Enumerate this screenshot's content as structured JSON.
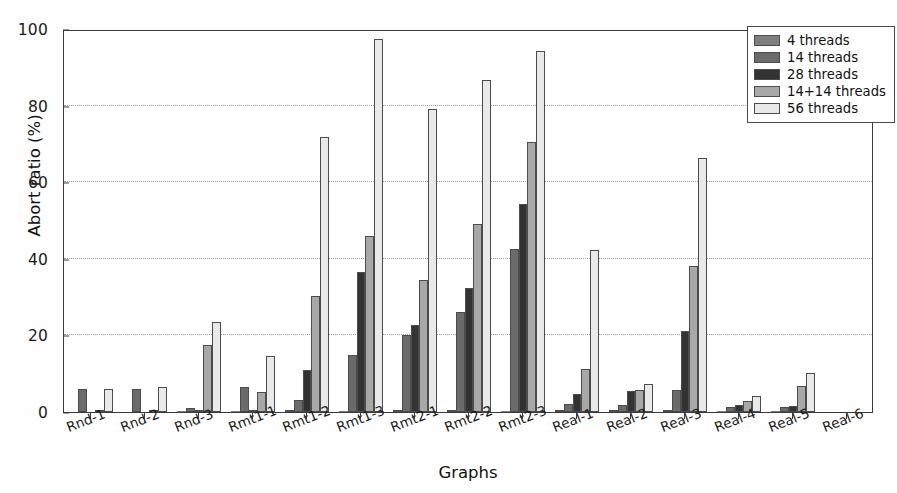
{
  "chart_data": {
    "type": "bar",
    "title": "",
    "xlabel": "Graphs",
    "ylabel": "Abort ratio (%)",
    "ylim": [
      0,
      100
    ],
    "yticks": [
      0,
      20,
      40,
      60,
      80,
      100
    ],
    "grid": "horizontal dotted at 20, 40, 60, 80",
    "legend_position": "upper right",
    "categories": [
      "Rnd-1",
      "Rnd-2",
      "Rnd-3",
      "Rmt1-1",
      "Rmt1-2",
      "Rmt1-3",
      "Rmt2-1",
      "Rmt2-2",
      "Rmt2-3",
      "Real-1",
      "Real-2",
      "Real-3",
      "Real-4",
      "Real-5",
      "Real-6"
    ],
    "series": [
      {
        "name": "4 threads",
        "color": "#7f7f7f",
        "values": [
          0.0,
          0.0,
          0.3,
          0.3,
          0.6,
          0.3,
          0.4,
          0.5,
          0.3,
          0.4,
          0.4,
          0.4,
          0.3,
          0.3,
          0.0
        ]
      },
      {
        "name": "14 threads",
        "color": "#6b6b6b",
        "values": [
          5.9,
          5.9,
          1.0,
          6.5,
          3.2,
          14.8,
          20.1,
          26.2,
          42.6,
          2.1,
          1.9,
          5.7,
          1.2,
          1.4,
          0.0
        ]
      },
      {
        "name": "28 threads",
        "color": "#333333",
        "values": [
          0.0,
          0.0,
          0.4,
          0.4,
          11.0,
          36.6,
          22.8,
          32.5,
          54.3,
          4.6,
          5.6,
          21.1,
          1.9,
          1.6,
          0.0
        ]
      },
      {
        "name": "14+14 threads",
        "color": "#a8a8a8",
        "values": [
          0.4,
          0.5,
          17.4,
          5.3,
          30.2,
          46.0,
          34.4,
          49.0,
          70.5,
          11.2,
          5.7,
          38.2,
          2.8,
          6.7,
          0.0
        ]
      },
      {
        "name": "56 threads",
        "color": "#e9e9e9",
        "values": [
          5.9,
          6.5,
          23.4,
          14.7,
          71.8,
          88.0,
          53.6,
          66.8,
          82.9,
          26.8,
          7.4,
          66.4,
          4.2,
          10.2,
          0.0
        ]
      }
    ],
    "extra_tall_bars": [
      {
        "category": "Rmt1-3",
        "series": "56 threads",
        "value": 97.4
      },
      {
        "category": "Rmt2-1",
        "series": "56 threads",
        "value": 79.0
      },
      {
        "category": "Rmt2-2",
        "series": "56 threads",
        "value": 86.6
      },
      {
        "category": "Rmt2-3",
        "series": "56 threads",
        "value": 94.3
      },
      {
        "category": "Real-1",
        "series": "56 threads",
        "value": 42.3
      }
    ]
  },
  "legend": {
    "items": [
      {
        "label": "4 threads"
      },
      {
        "label": "14 threads"
      },
      {
        "label": "28 threads"
      },
      {
        "label": "14+14 threads"
      },
      {
        "label": "56 threads"
      }
    ]
  }
}
